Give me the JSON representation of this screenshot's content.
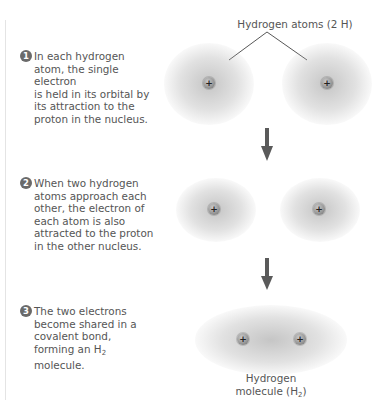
{
  "diagram": {
    "title_label": "Hydrogen atoms (2 H)",
    "steps": [
      {
        "number": "1",
        "text": "In each hydrogen\natom, the single electron\nis held in its orbital by\nits attraction to the\nproton in the nucleus."
      },
      {
        "number": "2",
        "text": "When two hydrogen\natoms approach each\nother, the electron of\neach atom is also\nattracted to the proton\nin the other nucleus."
      },
      {
        "number": "3",
        "text_before_sub": "The two electrons\nbecome shared in a\ncovalent bond,\nforming an H",
        "subscript": "2",
        "text_after_sub": "\nmolecule."
      }
    ],
    "proton_symbol": "+",
    "molecule_label": {
      "line1": "Hydrogen",
      "line2_prefix": "molecule (H",
      "subscript": "2",
      "line2_suffix": ")"
    },
    "colors": {
      "text": "#555555",
      "badge": "#6a6a6a",
      "arrow": "#5a5a5a",
      "cloud": "#9a9a9a"
    },
    "icons": [
      "number-badge-icon",
      "proton-icon",
      "down-arrow-icon"
    ]
  }
}
